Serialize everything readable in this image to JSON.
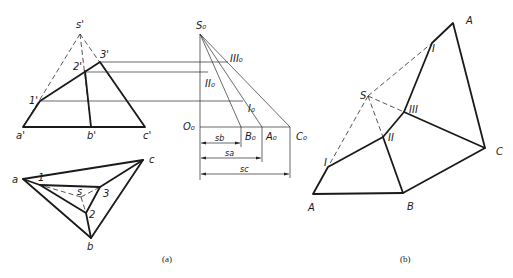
{
  "figure": {
    "part_a": {
      "caption": "(a)",
      "front_view": {
        "labels": {
          "s": "s'",
          "p1": "1'",
          "p2": "2'",
          "p3": "3'",
          "a": "a'",
          "b": "b'",
          "c": "c'"
        }
      },
      "top_view": {
        "labels": {
          "a": "a",
          "b": "b",
          "c": "c",
          "s": "s",
          "p1": "1",
          "p2": "2",
          "p3": "3"
        }
      },
      "true_length_diagram": {
        "labels": {
          "s0": "S₀",
          "o0": "O₀",
          "a0": "A₀",
          "b0": "B₀",
          "c0": "C₀",
          "i0": "I₀",
          "ii0": "II₀",
          "iii0": "III₀"
        },
        "dimensions": {
          "sb": "sb",
          "sa": "sa",
          "sc": "sc"
        }
      }
    },
    "part_b": {
      "caption": "(b)",
      "development": {
        "labels": {
          "s": "S",
          "a_top": "A",
          "i_top": "I",
          "iii": "III",
          "ii": "II",
          "i_bottom": "I",
          "a_bottom": "A",
          "b": "B",
          "c": "C"
        }
      }
    }
  }
}
